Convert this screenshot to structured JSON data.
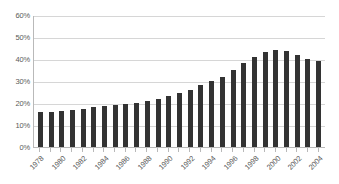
{
  "chart_data": {
    "type": "bar",
    "title": "",
    "subtitle": "",
    "xlabel": "",
    "ylabel": "",
    "grid": true,
    "legend": false,
    "legend_position": "none",
    "ylim": [
      0,
      60
    ],
    "ytick_labels": [
      "60%",
      "50%",
      "40%",
      "30%",
      "20%",
      "10%",
      "0%"
    ],
    "ytick_values": [
      60,
      50,
      40,
      30,
      20,
      10,
      0
    ],
    "categories": [
      "1978",
      "1979",
      "1980",
      "1981",
      "1982",
      "1983",
      "1984",
      "1985",
      "1986",
      "1987",
      "1988",
      "1989",
      "1990",
      "1991",
      "1992",
      "1993",
      "1994",
      "1995",
      "1996",
      "1997",
      "1998",
      "1999",
      "2000",
      "2001",
      "2002",
      "2003",
      "2004"
    ],
    "xtick_labels_shown": [
      "1978",
      "",
      "1980",
      "",
      "1982",
      "",
      "1984",
      "",
      "1986",
      "",
      "1988",
      "",
      "1990",
      "",
      "1992",
      "",
      "1994",
      "",
      "1996",
      "",
      "1998",
      "",
      "2000",
      "",
      "2002",
      "",
      "2004"
    ],
    "values": [
      16,
      16,
      16.5,
      17,
      17.5,
      18,
      18.5,
      19,
      19.5,
      20,
      21,
      22,
      23,
      24.5,
      26,
      28,
      30,
      32,
      35,
      38,
      41,
      43,
      44,
      43.5,
      42,
      40,
      39
    ],
    "bar_color": "#333333",
    "gridline_color": "#d6d6d6",
    "axis_color": "#b9b9b9",
    "tick_label_color": "#5a5a5a",
    "background_color": "#ffffff"
  }
}
